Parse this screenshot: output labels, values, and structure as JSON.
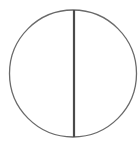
{
  "diagram": {
    "shape": "circle-bisected-vertically",
    "circle": {
      "cx": 73,
      "cy": 73.5,
      "r": 63.5,
      "stroke": "#6a6a6a",
      "stroke_width": 1.3
    },
    "divider": {
      "x": 74,
      "y1": 10,
      "y2": 137,
      "stroke": "#4a4a4a",
      "stroke_width": 2.2
    },
    "background": "#ffffff"
  }
}
